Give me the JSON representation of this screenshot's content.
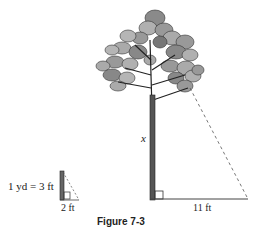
{
  "figure": {
    "caption": "Figure 7-3",
    "conversion_note": "1 yd = 3 ft",
    "small_triangle": {
      "base_label": "2 ft"
    },
    "tree": {
      "height_label": "x"
    },
    "shadow": {
      "base_label": "11 ft"
    }
  },
  "colors": {
    "line": "#333333",
    "foliage_dark": "#777777",
    "foliage_light": "#b0b0b0",
    "dashed": "#555555"
  }
}
